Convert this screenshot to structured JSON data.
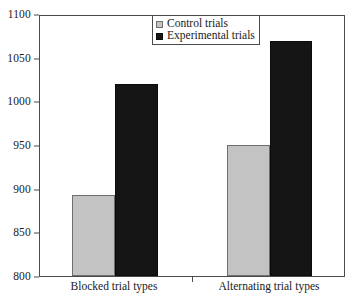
{
  "chart_data": {
    "type": "bar",
    "title": "",
    "xlabel": "",
    "ylabel": "",
    "categories": [
      "Blocked trial types",
      "Alternating trial types"
    ],
    "series": [
      {
        "name": "Control trials",
        "values": [
          893,
          951
        ],
        "color": "#c3c3c3"
      },
      {
        "name": "Experimental trials",
        "values": [
          1022,
          1071
        ],
        "color": "#151515"
      }
    ],
    "ylim": [
      800,
      1100
    ],
    "yticks": [
      800,
      850,
      900,
      950,
      1000,
      1050,
      1100
    ],
    "ytick_labels": [
      "800",
      "850",
      "900",
      "950",
      "1000",
      "1050",
      "1100"
    ],
    "grid": false,
    "legend_position": "top-center",
    "legend_entries": [
      "Control trials",
      "Experimental trials"
    ]
  },
  "axes": {
    "y": {
      "ticks": [
        {
          "value": 1100,
          "label": "1100"
        },
        {
          "value": 1050,
          "label": "1050"
        },
        {
          "value": 1000,
          "label": "1000"
        },
        {
          "value": 950,
          "label": "950"
        },
        {
          "value": 900,
          "label": "900"
        },
        {
          "value": 850,
          "label": "850"
        },
        {
          "value": 800,
          "label": "800"
        }
      ]
    },
    "x": {
      "groups": [
        {
          "label": "Blocked trial types"
        },
        {
          "label": "Alternating trial types"
        }
      ]
    }
  },
  "legend": {
    "items": [
      {
        "label": "Control trials",
        "swatch": "control-swatch"
      },
      {
        "label": "Experimental trials",
        "swatch": "experimental-swatch"
      }
    ]
  }
}
